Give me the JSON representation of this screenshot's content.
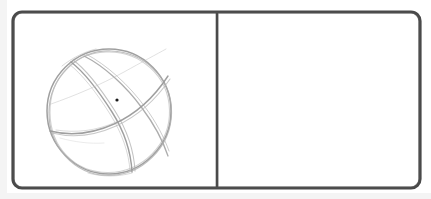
{
  "scene": {
    "type": "hand-drawn-sketch",
    "medium": "pencil sketch",
    "background_color": "#ffffff",
    "width": 431,
    "height": 199,
    "description": "Two-panel sketch frame with a wireframe sphere drawn in the left panel and an empty right panel"
  },
  "frame": {
    "label": "sketch-frame",
    "stroke_color": "#4a4a4a",
    "stroke_width": 3.2,
    "corner_radius": 9,
    "x": 13,
    "y": 12,
    "width": 407,
    "height": 176,
    "fill": "#ffffff"
  },
  "divider": {
    "label": "panel-divider",
    "stroke_color": "#4a4a4a",
    "stroke_width": 2.6,
    "x": 217,
    "y_top": 12,
    "y_bottom": 188
  },
  "panels": [
    {
      "id": "left-panel",
      "label": "Left panel",
      "x": 13,
      "y": 12,
      "width": 204,
      "height": 176,
      "content": "wireframe-sphere-sketch"
    },
    {
      "id": "right-panel",
      "label": "Right panel",
      "x": 217,
      "y": 12,
      "width": 203,
      "height": 176,
      "content": "empty"
    }
  ],
  "sphere": {
    "label": "wireframe-sphere",
    "center_x": 109,
    "center_y": 111,
    "radius": 62,
    "stroke_color": "#9a9a9a",
    "stroke_color_light": "#b4b4b4",
    "stroke_width": 1.3,
    "sketch_passes": 3,
    "meridian_count": 2,
    "equator_count": 1
  },
  "marker_dot": {
    "label": "center-point-dot",
    "x": 117,
    "y": 100,
    "radius": 1.6,
    "color": "#1a1a1a"
  },
  "chart_data": {
    "type": "scatter",
    "title": "",
    "xlabel": "",
    "ylabel": "",
    "x": [
      117
    ],
    "y": [
      100
    ],
    "xlim": [
      13,
      420
    ],
    "ylim": [
      12,
      188
    ],
    "grid": false,
    "legend": "none",
    "annotations": [
      "wireframe sphere outline, center (109, 111), radius 62",
      "single black point marker at (117, 100)",
      "vertical divider at x = 217"
    ]
  }
}
